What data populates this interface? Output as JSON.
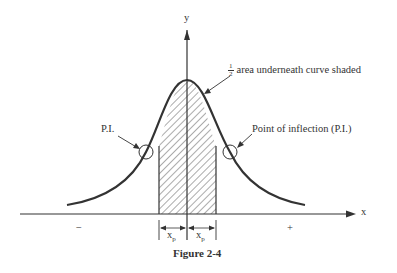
{
  "diagram": {
    "title": "Figure 2-4",
    "axes": {
      "x_label": "x",
      "y_label": "y",
      "negative_sign": "−",
      "positive_sign": "+"
    },
    "annotations": {
      "shaded_fraction_num": "1",
      "shaded_fraction_den": "2",
      "shaded_text": "area underneath curve shaded",
      "pi_left": "P.I.",
      "pi_right": "Point of inflection (P.I.)"
    },
    "interval_labels": [
      {
        "base": "x",
        "sub": "p"
      },
      {
        "base": "x",
        "sub": "p"
      }
    ],
    "colors": {
      "line": "#333333",
      "hatch": "#444444",
      "background": "#ffffff"
    }
  }
}
